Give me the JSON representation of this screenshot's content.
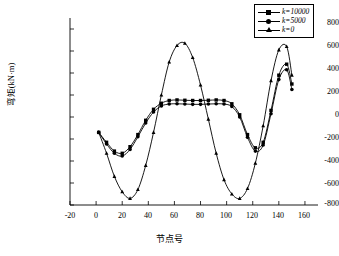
{
  "chart_data": {
    "type": "line",
    "title": "",
    "xlabel": "节点号",
    "ylabel": "弯矩(kN·m)",
    "xlim": [
      -20,
      170
    ],
    "ylim": [
      -800,
      900
    ],
    "xticks": [
      -20,
      0,
      20,
      40,
      60,
      80,
      100,
      120,
      140,
      160
    ],
    "yticks": [
      -800,
      -600,
      -400,
      -200,
      0,
      200,
      400,
      600,
      800
    ],
    "grid": false,
    "legend_position": "top-right",
    "series": [
      {
        "name": "k=10000",
        "marker": "square",
        "color": "#000000",
        "x": [
          2,
          8,
          14,
          20,
          26,
          32,
          38,
          44,
          50,
          56,
          62,
          68,
          74,
          80,
          86,
          92,
          98,
          104,
          110,
          116,
          122,
          128,
          134,
          140,
          146,
          150
        ],
        "y": [
          -140,
          -230,
          -310,
          -330,
          -270,
          -160,
          -30,
          70,
          125,
          150,
          155,
          152,
          150,
          150,
          152,
          155,
          150,
          120,
          20,
          -160,
          -280,
          -230,
          60,
          380,
          480,
          300
        ]
      },
      {
        "name": "k=5000",
        "marker": "circle",
        "color": "#000000",
        "x": [
          2,
          8,
          14,
          20,
          26,
          32,
          38,
          44,
          50,
          56,
          62,
          68,
          74,
          80,
          86,
          92,
          98,
          104,
          110,
          116,
          122,
          128,
          134,
          140,
          146,
          150
        ],
        "y": [
          -140,
          -245,
          -330,
          -355,
          -295,
          -180,
          -55,
          45,
          100,
          118,
          120,
          118,
          115,
          115,
          118,
          120,
          118,
          95,
          0,
          -185,
          -310,
          -255,
          30,
          340,
          430,
          250
        ]
      },
      {
        "name": "k=0",
        "marker": "triangle",
        "color": "#000000",
        "x": [
          2,
          8,
          14,
          20,
          26,
          32,
          38,
          44,
          50,
          56,
          62,
          68,
          74,
          80,
          86,
          92,
          98,
          104,
          110,
          116,
          122,
          128,
          134,
          140,
          146,
          150
        ],
        "y": [
          -140,
          -330,
          -540,
          -680,
          -740,
          -660,
          -440,
          -140,
          200,
          500,
          650,
          670,
          540,
          290,
          -20,
          -330,
          -570,
          -700,
          -740,
          -650,
          -420,
          -80,
          330,
          610,
          640,
          380
        ]
      }
    ]
  },
  "legend": {
    "items": [
      {
        "label": "k=10000",
        "marker": "square"
      },
      {
        "label": "k=5000",
        "marker": "circle"
      },
      {
        "label": "k=0",
        "marker": "triangle"
      }
    ]
  },
  "axes": {
    "x_label": "节点号",
    "y_label": "弯矩(kN·m)",
    "x_tick_labels": [
      "-20",
      "0",
      "20",
      "40",
      "60",
      "80",
      "100",
      "120",
      "140",
      "160"
    ],
    "y_tick_labels": [
      "800",
      "600",
      "400",
      "200",
      "0",
      "-200",
      "-400",
      "-600",
      "-800"
    ]
  }
}
